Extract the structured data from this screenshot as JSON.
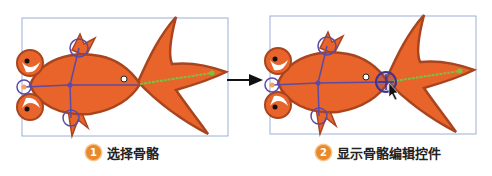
{
  "panels": [
    {
      "step": "1",
      "caption": "选择骨骼",
      "state": "bone-selected"
    },
    {
      "step": "2",
      "caption": "显示骨骼编辑控件",
      "state": "bone-edit-controls-shown"
    }
  ],
  "colors": {
    "fish_fill": "#e8642a",
    "fish_stroke": "#a8441e",
    "bone": "#5b4aa6",
    "selected_bone": "#7ac143",
    "frame": "#9ab0d8",
    "badge": "#e8892a"
  }
}
